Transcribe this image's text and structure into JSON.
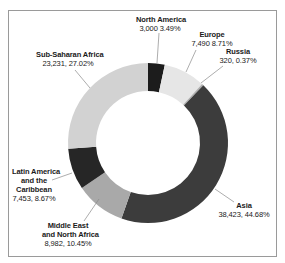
{
  "chart_data": {
    "type": "pie",
    "subtype": "donut",
    "title": "",
    "unit": "",
    "categories": [
      "North America",
      "Europe",
      "Russia",
      "Asia",
      "Middle East and North Africa",
      "Latin America and the Caribbean",
      "Sub-Saharan Africa"
    ],
    "values": [
      3000,
      7490,
      320,
      38423,
      8982,
      7453,
      23231
    ],
    "percentages": [
      3.49,
      8.71,
      0.37,
      44.68,
      10.45,
      8.67,
      27.02
    ],
    "colors": [
      "#1c1c1c",
      "#e6e6e6",
      "#b0b0b0",
      "#3c3c3c",
      "#a9a9a9",
      "#262626",
      "#d2d2d2"
    ],
    "legend": "none (leader-line labels)",
    "start_angle_deg": 0,
    "direction": "clockwise"
  },
  "labels": [
    {
      "name": "North America",
      "value": "3,000 3.49%"
    },
    {
      "name": "Europe",
      "value": "7,490 8.71%"
    },
    {
      "name": "Russia",
      "value": "320, 0.37%"
    },
    {
      "name": "Asia",
      "value": "38,423, 44.68%"
    },
    {
      "name": "Middle East",
      "name2": "and North Africa",
      "value": "8,982, 10.45%"
    },
    {
      "name": "Latin America",
      "name2": "and the",
      "name3": "Caribbean",
      "value": "7,453, 8.67%"
    },
    {
      "name": "Sub-Saharan Africa",
      "value": "23,231, 27.02%"
    }
  ]
}
